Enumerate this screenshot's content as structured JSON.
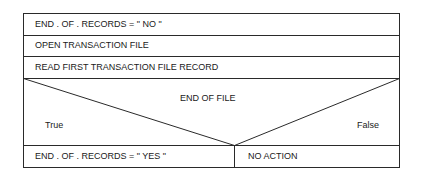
{
  "diagram": {
    "type": "nassi-shneiderman",
    "line_color": "#2a2a2a",
    "steps": [
      {
        "text": "END . OF . RECORDS = \" NO \""
      },
      {
        "text": "OPEN TRANSACTION FILE"
      },
      {
        "text": "READ FIRST TRANSACTION FILE RECORD"
      }
    ],
    "decision": {
      "condition": "END OF FILE",
      "true_label": "True",
      "false_label": "False",
      "true_branch": "END . OF . RECORDS = \" YES \"",
      "false_branch": "NO ACTION"
    }
  }
}
